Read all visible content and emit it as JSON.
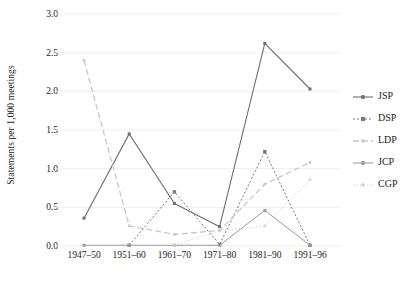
{
  "chart_data": {
    "type": "line",
    "title": "",
    "xlabel": "",
    "ylabel": "Statements per 1,000 meetings",
    "categories": [
      "1947–50",
      "1951–60",
      "1961–70",
      "1971–80",
      "1981–90",
      "1991–96"
    ],
    "ylim": [
      0.0,
      3.0
    ],
    "yticks": [
      "0.0",
      "0.5",
      "1.0",
      "1.5",
      "2.0",
      "2.5",
      "3.0"
    ],
    "ytick_values": [
      0.0,
      0.5,
      1.0,
      1.5,
      2.0,
      2.5,
      3.0
    ],
    "grid": "horizontal",
    "legend_position": "right",
    "series": [
      {
        "name": "JSP",
        "values": [
          0.36,
          1.45,
          0.55,
          0.25,
          2.62,
          2.03
        ],
        "color": "#6e6e6e",
        "dash": "none",
        "marker": "square",
        "marker_size": 3.0,
        "width": 1.1
      },
      {
        "name": "DSP",
        "values": [
          null,
          0.01,
          0.7,
          0.02,
          1.22,
          0.01
        ],
        "color": "#787878",
        "dash": "2,2",
        "marker": "square",
        "marker_size": 3.4,
        "width": 1.0
      },
      {
        "name": "LDP",
        "values": [
          2.4,
          0.26,
          0.15,
          0.2,
          0.8,
          1.08
        ],
        "color": "#c8c8c8",
        "dash": "6,3",
        "marker": "square",
        "marker_size": 2.6,
        "width": 1.3
      },
      {
        "name": "JCP",
        "values": [
          0.01,
          0.01,
          0.01,
          0.01,
          0.46,
          0.01
        ],
        "color": "#9a9a9a",
        "dash": "none",
        "marker": "square",
        "marker_size": 3.0,
        "width": 1.0
      },
      {
        "name": "CGP",
        "values": [
          null,
          null,
          0.01,
          0.2,
          0.26,
          0.86
        ],
        "color": "#d2d2d2",
        "dash": "1.5,2",
        "marker": "square",
        "marker_size": 2.6,
        "width": 1.0
      }
    ]
  },
  "axes": {
    "y_title": "Statements per 1,000 meetings"
  },
  "legend": {
    "items": [
      {
        "label": "JSP"
      },
      {
        "label": "DSP"
      },
      {
        "label": "LDP"
      },
      {
        "label": "JCP"
      },
      {
        "label": "CGP"
      }
    ]
  },
  "colors": {
    "gridline": "#ededed",
    "axis_text": "#232323",
    "background": "#ffffff"
  }
}
